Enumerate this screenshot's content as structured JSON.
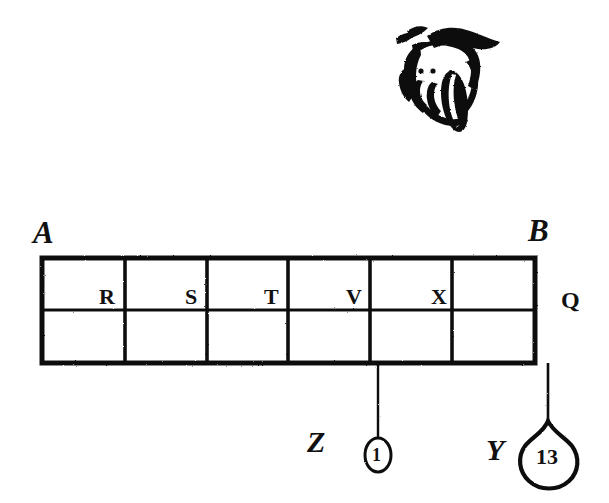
{
  "figure": {
    "kind": "engraving-diagram",
    "title_visible": false,
    "ink_color": "#111111",
    "background_color": "#ffffff"
  },
  "manicule": {
    "name": "pointing-hand",
    "description": "hand with extended index finger pointing down",
    "pointer_line_x": 462,
    "pointer_line_top": 118,
    "pointer_line_bottom": 258
  },
  "table": {
    "left": 42,
    "right": 535,
    "top": 258,
    "bottom": 363,
    "divider_y": 310,
    "columns": 6,
    "rows": 2,
    "column_x": [
      42,
      125,
      207,
      288,
      370,
      452,
      535
    ],
    "corner_labels": {
      "top_left": "A",
      "top_right": "B",
      "right_middle": "Q"
    },
    "cell_labels": [
      {
        "text": "R",
        "x": 108,
        "y": 299
      },
      {
        "text": "S",
        "x": 191,
        "y": 299
      },
      {
        "text": "T",
        "x": 271,
        "y": 299
      },
      {
        "text": "V",
        "x": 353,
        "y": 299
      },
      {
        "text": "X",
        "x": 437,
        "y": 299
      }
    ]
  },
  "drops": [
    {
      "name": "drop-z",
      "label": "Z",
      "label_x": 310,
      "label_y": 431,
      "line_x": 378,
      "line_top": 363,
      "line_bottom": 437,
      "bubble_cx": 378,
      "bubble_cy": 455,
      "bubble_rx": 13,
      "bubble_ry": 17,
      "value": "1"
    },
    {
      "name": "drop-y",
      "label": "Y",
      "label_x": 487,
      "label_y": 437,
      "line_x": 548,
      "line_top": 363,
      "line_bottom": 418,
      "bubble_cx": 548,
      "bubble_cy": 457,
      "bubble_rx": 30,
      "bubble_ry": 32,
      "value": "13"
    }
  ]
}
